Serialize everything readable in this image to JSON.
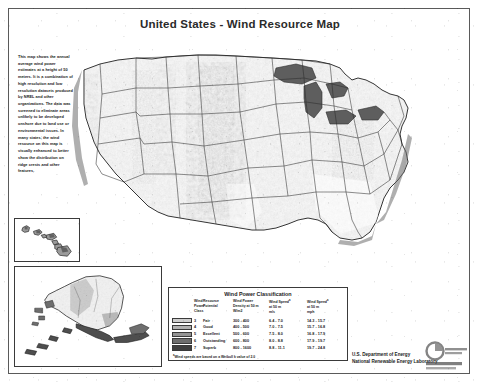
{
  "document": {
    "title": "United States - Wind Resource Map",
    "background_color": "#ffffff",
    "frame_color": "#5a5a5a"
  },
  "description": {
    "text": "This map shows the annual average wind power estimates at a height of 50 meters. It is a combination of high resolution and low resolution datasets produced by NREL and other organizations. The data was screened to eliminate areas unlikely to be developed onshore due to land use or environmental issues. In many states, the wind resource on this map is visually enhanced to better show the distribution on ridge crests and other features."
  },
  "insets": {
    "hawaii": {
      "name": "Hawaii inset"
    },
    "alaska": {
      "name": "Alaska inset"
    }
  },
  "legend": {
    "title": "Wind Power Classification",
    "headers": {
      "swatch": "",
      "class": "Wind Power Class",
      "potential": "Resource Potential",
      "density": "Wind Power Density at 50 m W/m2",
      "speed_ms": "Wind Speed a at 50 m m/s",
      "speed_mph": "Wind Speed a at 50 m mph"
    },
    "header_lines": {
      "class": [
        "Wind",
        "Power",
        "Class"
      ],
      "potential": [
        "Resource",
        "Potential",
        ""
      ],
      "density": [
        "Wind Power",
        "Density at 50 m",
        "W/m2"
      ],
      "speed_ms": [
        "Wind Speed",
        "at 50 m",
        "m/s"
      ],
      "speed_mph": [
        "Wind Speed",
        "at 50 m",
        "mph"
      ]
    },
    "rows": [
      {
        "class": "3",
        "potential": "Fair",
        "density": "300 - 400",
        "speed_ms": "6.4 - 7.0",
        "speed_mph": "14.3 - 15.7",
        "color": "#cfcfcf"
      },
      {
        "class": "4",
        "potential": "Good",
        "density": "400 - 500",
        "speed_ms": "7.0 - 7.5",
        "speed_mph": "15.7 - 16.8",
        "color": "#b2b2b2"
      },
      {
        "class": "5",
        "potential": "Excellent",
        "density": "500 - 600",
        "speed_ms": "7.5 - 8.0",
        "speed_mph": "16.8 - 17.9",
        "color": "#949494"
      },
      {
        "class": "6",
        "potential": "Outstanding",
        "density": "600 - 800",
        "speed_ms": "8.0 - 8.8",
        "speed_mph": "17.9 - 19.7",
        "color": "#6e6e6e"
      },
      {
        "class": "7",
        "potential": "Superb",
        "density": "800 - 1600",
        "speed_ms": "8.8 - 11.1",
        "speed_mph": "19.7 - 24.8",
        "color": "#3f3f3f"
      }
    ],
    "footnote": "Wind speeds are based on a Weibull k value of 2.0"
  },
  "credit": {
    "line1": "U.S. Department of Energy",
    "line2": "National Renewable Energy Laboratory"
  },
  "chart_data": {
    "type": "heatmap",
    "title": "United States - Wind Resource Map",
    "categories": [
      "3 Fair",
      "4 Good",
      "5 Excellent",
      "6 Outstanding",
      "7 Superb"
    ],
    "legend_position": "bottom-center",
    "series": [
      {
        "name": "Wind Power Density (W/m2) lower bound",
        "values": [
          300,
          400,
          500,
          600,
          800
        ]
      },
      {
        "name": "Wind Power Density (W/m2) upper bound",
        "values": [
          400,
          500,
          600,
          800,
          1600
        ]
      },
      {
        "name": "Wind Speed (m/s) lower bound",
        "values": [
          6.4,
          7.0,
          7.5,
          8.0,
          8.8
        ]
      },
      {
        "name": "Wind Speed (m/s) upper bound",
        "values": [
          7.0,
          7.5,
          8.0,
          8.8,
          11.1
        ]
      },
      {
        "name": "Wind Speed (mph) lower bound",
        "values": [
          14.3,
          15.7,
          16.8,
          17.9,
          19.7
        ]
      },
      {
        "name": "Wind Speed (mph) upper bound",
        "values": [
          15.7,
          16.8,
          17.9,
          19.7,
          24.8
        ]
      }
    ],
    "colors": [
      "#cfcfcf",
      "#b2b2b2",
      "#949494",
      "#6e6e6e",
      "#3f3f3f"
    ],
    "xlabel": "",
    "ylabel": "",
    "grid": false
  }
}
